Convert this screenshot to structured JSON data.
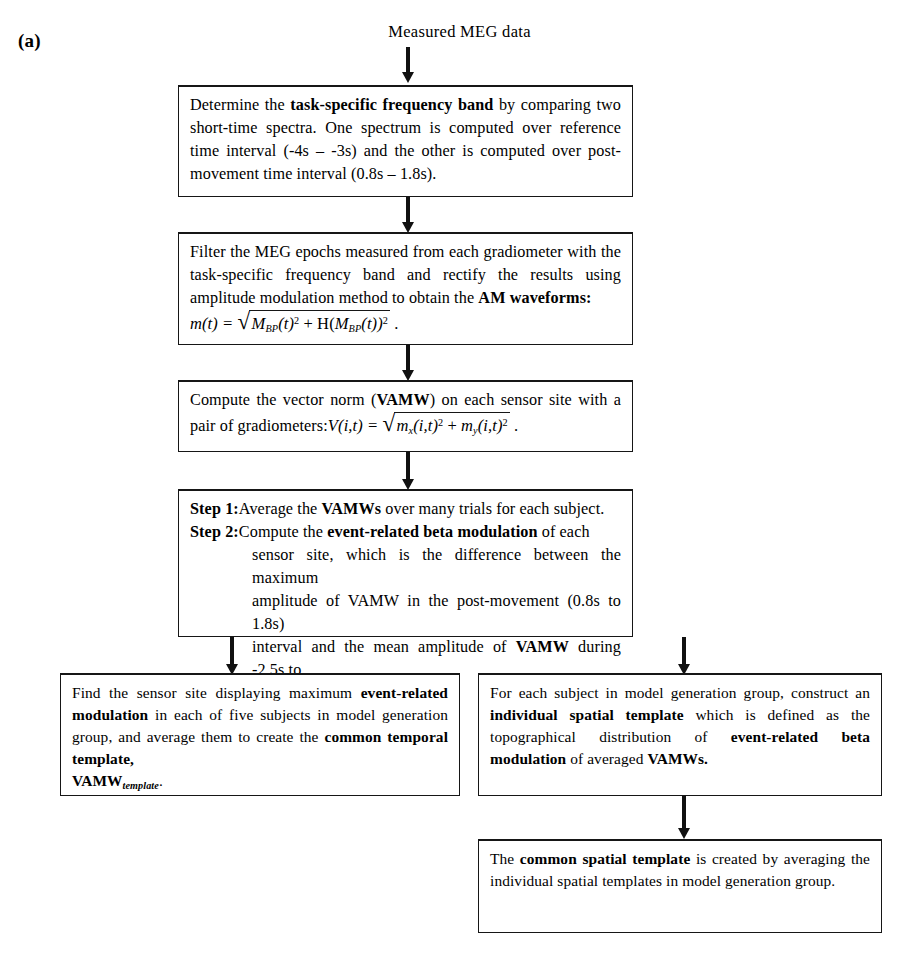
{
  "figure": {
    "panel_label": "(a)",
    "source_label": "Measured MEG data"
  },
  "nodes": {
    "determine_band": {
      "text_part1": "Determine the ",
      "bold1": "task-specific frequency band",
      "text_part2": " by comparing two short-time spectra. One spectrum is computed over reference time interval (-4s – -3s) and the other is computed over post-movement time interval (0.8s – 1.8s)."
    },
    "filter_am": {
      "text_part1": "Filter the MEG epochs measured from each gradiometer with the task-specific frequency band and rectify the results using amplitude modulation method to obtain the ",
      "bold1": "AM waveforms:",
      "formula": {
        "lhs": "m(t) =",
        "term1_base": "M",
        "term1_sub": "BP",
        "term1_arg": "(t)",
        "term1_exp": "2",
        "operator": "+",
        "term2_fn": "H(",
        "term2_base": "M",
        "term2_sub": "BP",
        "term2_arg": "(t))",
        "term2_exp": "2",
        "trailing": "."
      }
    },
    "vector_norm": {
      "text_part1": "Compute the vector norm (",
      "bold1": "VAMW",
      "text_part2": ") on each sensor site with a pair of gradiometers:",
      "formula": {
        "lhs": "V(i,t) =",
        "term1_base": "m",
        "term1_sub": "x",
        "term1_arg": "(i,t)",
        "term1_exp": "2",
        "operator": "+",
        "term2_base": "m",
        "term2_sub": "y",
        "term2_arg": "(i,t)",
        "term2_exp": "2",
        "trailing": "."
      }
    },
    "steps": {
      "step1_tag": "Step 1",
      "step1_sep": ":",
      "step1_text1": "Average the ",
      "step1_bold": "VAMWs",
      "step1_text2": " over many trials for each subject.",
      "step2_tag": "Step 2",
      "step2_sep": ":",
      "step2_text1": "Compute the ",
      "step2_bold1": "event-related beta modulation",
      "step2_text2": " of each",
      "step2_line2": "sensor site, which is the difference between the maximum",
      "step2_line3": "amplitude of VAMW in the post-movement (0.8s to 1.8s)",
      "step2_line4a": "interval and the mean amplitude of ",
      "step2_line4bold": "VAMW",
      "step2_line4b": " during -2.5s to",
      "step2_line5": "-2s."
    },
    "temporal_template": {
      "text_part1": "Find the sensor site displaying maximum ",
      "bold1": "event-related modulation",
      "text_part2": " in each of five subjects in model generation group, and average them to create the ",
      "bold2": "common temporal template,",
      "bold3": "VAMW",
      "sub3": "template",
      "text_part3": "."
    },
    "spatial_template": {
      "text_part1": "For each subject in model generation group, construct an ",
      "bold1": "individual spatial template",
      "text_part2": " which is defined as the topographical distribution of ",
      "bold2": "event-related beta modulation",
      "text_part3": " of averaged ",
      "bold3": "VAMWs."
    },
    "common_spatial": {
      "text_part1": "The ",
      "bold1": "common spatial template",
      "text_part2": " is created by averaging the individual spatial templates in model generation group."
    }
  }
}
